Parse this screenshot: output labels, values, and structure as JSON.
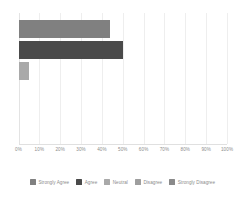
{
  "chart_data": {
    "type": "bar",
    "orientation": "horizontal",
    "title": "",
    "subtitle": "",
    "xlabel": "",
    "ylabel": "",
    "categories": [
      "Strongly Agree",
      "Agree",
      "Neutral",
      "Disagree",
      "Strongly Disagree"
    ],
    "values": [
      44,
      50,
      5,
      0,
      0
    ],
    "xlim": [
      0,
      100
    ],
    "xticks": [
      0,
      10,
      20,
      30,
      40,
      50,
      60,
      70,
      80,
      90,
      100
    ],
    "xtick_labels": [
      "0%",
      "10%",
      "20%",
      "30%",
      "40%",
      "50%",
      "60%",
      "70%",
      "80%",
      "90%",
      "100%"
    ],
    "grid": true,
    "grid_axis": "x",
    "legend": true,
    "legend_position": "bottom",
    "legend_entries": [
      {
        "label": "Strongly Agree",
        "color": "#808080",
        "value": 44
      },
      {
        "label": "Agree",
        "color": "#4a4a4a",
        "value": 50
      },
      {
        "label": "Neutral",
        "color": "#a9a9a9",
        "value": 5
      },
      {
        "label": "Disagree",
        "color": "#9e9e9e",
        "value": 0
      },
      {
        "label": "Strongly Disagree",
        "color": "#8a8a8a",
        "value": 0
      }
    ],
    "annotations": []
  },
  "colors": {
    "background": "#ffffff",
    "gridline": "#eeeeee",
    "axis_line": "#e0e0e0",
    "tick_text": "#8c8c8c",
    "legend_text": "#8c8c8c"
  }
}
